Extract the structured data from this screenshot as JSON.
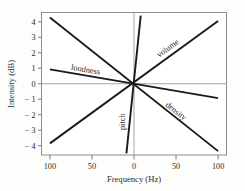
{
  "chart_data": {
    "type": "line",
    "title": "",
    "xlabel": "Frequency (Hz)",
    "ylabel": "Intensity (dB)",
    "xlim": [
      -110,
      110
    ],
    "ylim": [
      -4.6,
      4.6
    ],
    "grid": false,
    "legend_position": "inline-labels",
    "x_ticks": [
      {
        "value": -100,
        "label": "100"
      },
      {
        "value": -50,
        "label": "50"
      },
      {
        "value": 0,
        "label": "0"
      },
      {
        "value": 50,
        "label": "50"
      },
      {
        "value": 100,
        "label": "100"
      }
    ],
    "y_ticks": [
      {
        "value": 4,
        "label": "4"
      },
      {
        "value": 3,
        "label": "3"
      },
      {
        "value": 2,
        "label": "2"
      },
      {
        "value": 1,
        "label": "1"
      },
      {
        "value": 0,
        "label": "0"
      },
      {
        "value": -1,
        "label": "− 1"
      },
      {
        "value": -2,
        "label": "− 2"
      },
      {
        "value": -3,
        "label": "− 3"
      },
      {
        "value": -4,
        "label": "− 4"
      }
    ],
    "reference_lines": [
      {
        "name": "zero-intensity",
        "orientation": "horizontal",
        "value": 0,
        "color": "#9a9a9a"
      },
      {
        "name": "zero-frequency",
        "orientation": "vertical",
        "value": 0,
        "color": "#9a9a9a"
      }
    ],
    "series": [
      {
        "name": "loudness",
        "label": "loudness",
        "color": "#1a1a1a",
        "x": [
          -100,
          100
        ],
        "y": [
          0.93,
          -0.93
        ],
        "slope": -0.0093,
        "label_x": -58,
        "label_y": 0.75
      },
      {
        "name": "volume",
        "label": "volume",
        "color": "#1a1a1a",
        "x": [
          -100,
          100
        ],
        "y": [
          -3.85,
          4.05
        ],
        "slope": 0.0395,
        "label_x": 42,
        "label_y": 2.15
      },
      {
        "name": "density",
        "label": "density",
        "color": "#1a1a1a",
        "x": [
          -100,
          100
        ],
        "y": [
          4.28,
          -4.35
        ],
        "slope": -0.0432,
        "label_x": 48,
        "label_y": -1.9
      },
      {
        "name": "pitch",
        "label": "pitch",
        "color": "#1a1a1a",
        "x": [
          -9,
          8
        ],
        "y": [
          -4.5,
          4.4
        ],
        "slope": 0.52,
        "label_x": -11,
        "label_y": -2.45
      }
    ]
  }
}
